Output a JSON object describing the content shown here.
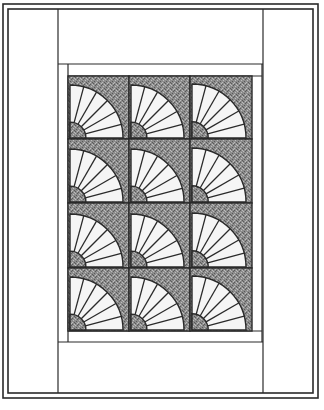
{
  "quilt": {
    "pattern": "grandmothers-fan",
    "rows": 4,
    "cols": 3,
    "blades_per_fan": 6,
    "colors": {
      "background": "#ffffff",
      "line": "#2a2a2a",
      "stipple_base": "#8c8c8c",
      "stipple_dark": "#5a5a5a",
      "stipple_light": "#bdbdbd",
      "blade_fill": "#f5f5f5"
    },
    "geometry": {
      "outer_border": [
        3,
        4,
        318,
        398
      ],
      "inner_border": [
        8,
        9,
        313,
        393
      ],
      "left_column_right": 58,
      "right_column_left": 263,
      "top_band_bottom": 64,
      "bottom_band_top": 342,
      "sashing_frame": [
        68,
        64,
        262,
        342
      ],
      "block_area": [
        68,
        76,
        252,
        331
      ],
      "col_edges": [
        68,
        129,
        190,
        252
      ],
      "row_edges": [
        76,
        139,
        203,
        268,
        331
      ]
    }
  }
}
